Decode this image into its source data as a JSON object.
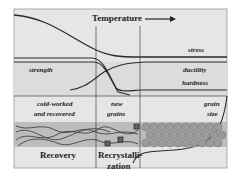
{
  "figure": {
    "header": {
      "title": "Temperature",
      "arrow": "right-arrow"
    },
    "curve_labels": {
      "stress": "stress",
      "strength": "strength",
      "ductility": "ductility",
      "hardness": "hardness",
      "grain_size_line1": "grain",
      "grain_size_line2": "size"
    },
    "microstructure_labels": {
      "cold_worked_line1": "cold-worked",
      "cold_worked_line2": "and recovered",
      "new_grains_line1": "new",
      "new_grains_line2": "grains"
    },
    "stages": {
      "recovery": "Recovery",
      "recrystallization_line1": "Recrystalli-",
      "recrystallization_line2": "zation"
    },
    "colors": {
      "background": "#e6e6e6",
      "band": "#bcbcbc",
      "line": "#2a2a2a",
      "grain": "#9a9a9a"
    }
  }
}
